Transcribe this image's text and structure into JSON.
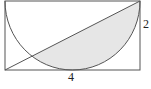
{
  "diagram": {
    "type": "geometry",
    "rectangle": {
      "width": 4,
      "height": 2
    },
    "labels": {
      "width_label": "4",
      "height_label": "2"
    },
    "colors": {
      "stroke": "#555555",
      "shade": "#e6e6e6",
      "background": "#ffffff"
    }
  }
}
